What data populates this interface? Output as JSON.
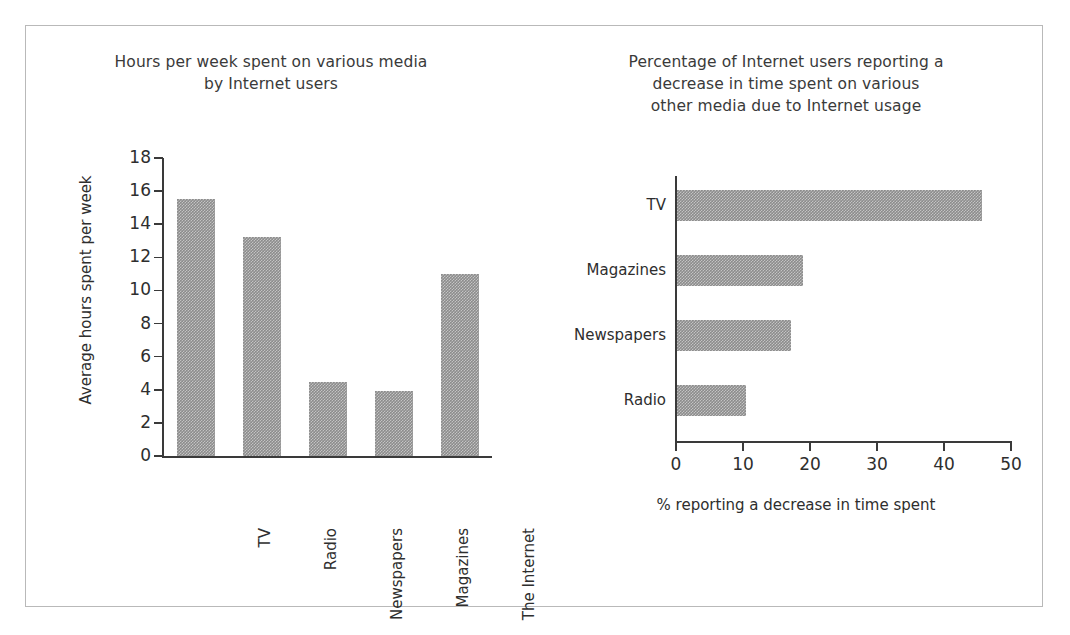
{
  "chart_data": [
    {
      "type": "bar",
      "title": "Hours per week spent on various media by Internet users",
      "title_lines": [
        "Hours per week spent on various media",
        "by Internet users"
      ],
      "orientation": "vertical",
      "categories": [
        "TV",
        "Radio",
        "Newspapers",
        "Magazines",
        "The Internet"
      ],
      "values": [
        15.5,
        13.2,
        4.5,
        3.9,
        11.0
      ],
      "xlabel": "",
      "ylabel": "Average hours spent per week",
      "ylim": [
        0,
        18
      ],
      "yticks": [
        0,
        2,
        4,
        6,
        8,
        10,
        12,
        14,
        16,
        18
      ],
      "ytick_labels": [
        "0",
        "2",
        "4",
        "6",
        "8",
        "10",
        "12",
        "14",
        "16",
        "18"
      ],
      "grid": false,
      "legend": "none",
      "bar_color": "#8c8c8c"
    },
    {
      "type": "bar",
      "title": "Percentage of Internet users reporting a decrease in time spent on various other media due to Internet usage",
      "title_lines": [
        "Percentage of Internet users reporting a",
        "decrease in time spent on various",
        "other media due to Internet usage"
      ],
      "orientation": "horizontal",
      "categories": [
        "TV",
        "Magazines",
        "Newspapers",
        "Radio"
      ],
      "values": [
        45.5,
        18.8,
        17.0,
        10.3
      ],
      "xlabel": "% reporting a decrease in time spent",
      "ylabel": "",
      "xlim": [
        0,
        50
      ],
      "xticks": [
        0,
        10,
        20,
        30,
        40,
        50
      ],
      "xtick_labels": [
        "0",
        "10",
        "20",
        "30",
        "40",
        "50"
      ],
      "grid": false,
      "legend": "none",
      "bar_color": "#8c8c8c"
    }
  ],
  "figure": {
    "border_color": "#b9b9b9",
    "background": "#ffffff"
  }
}
